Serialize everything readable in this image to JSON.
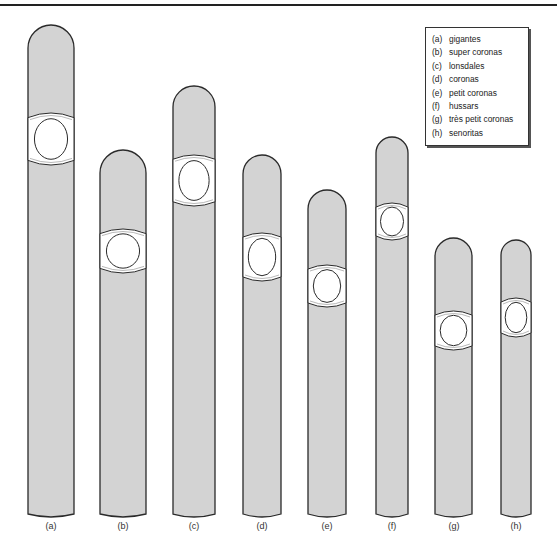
{
  "figure": {
    "colors": {
      "body_fill": "#d3d3d3",
      "outline": "#2a2a2a",
      "band_fill": "#ffffff"
    },
    "cigars": [
      {
        "key": "(a)",
        "name": "gigantes",
        "x": 28,
        "w": 46,
        "top": 25,
        "bottom": 514,
        "band_top": 113,
        "band_bottom": 165
      },
      {
        "key": "(b)",
        "name": "super coronas",
        "x": 100,
        "w": 46,
        "top": 150,
        "bottom": 514,
        "band_top": 229,
        "band_bottom": 273
      },
      {
        "key": "(c)",
        "name": "lonsdales",
        "x": 173,
        "w": 42,
        "top": 86,
        "bottom": 514,
        "band_top": 155,
        "band_bottom": 206
      },
      {
        "key": "(d)",
        "name": "coronas",
        "x": 243,
        "w": 38,
        "top": 155,
        "bottom": 514,
        "band_top": 233,
        "band_bottom": 281
      },
      {
        "key": "(e)",
        "name": "petit coronas",
        "x": 308,
        "w": 38,
        "top": 190,
        "bottom": 514,
        "band_top": 265,
        "band_bottom": 307
      },
      {
        "key": "(f)",
        "name": "hussars",
        "x": 376,
        "w": 32,
        "top": 137,
        "bottom": 514,
        "band_top": 203,
        "band_bottom": 240
      },
      {
        "key": "(g)",
        "name": "très petit coronas",
        "x": 435,
        "w": 37,
        "top": 238,
        "bottom": 514,
        "band_top": 311,
        "band_bottom": 350
      },
      {
        "key": "(h)",
        "name": "senoritas",
        "x": 501,
        "w": 30,
        "top": 240,
        "bottom": 514,
        "band_top": 298,
        "band_bottom": 337
      }
    ]
  },
  "legend": {
    "items": [
      {
        "key": "(a)",
        "label": "gigantes"
      },
      {
        "key": "(b)",
        "label": "super coronas"
      },
      {
        "key": "(c)",
        "label": "lonsdales"
      },
      {
        "key": "(d)",
        "label": "coronas"
      },
      {
        "key": "(e)",
        "label": "petit coronas"
      },
      {
        "key": "(f)",
        "label": "hussars"
      },
      {
        "key": "(g)",
        "label": "très petit coronas"
      },
      {
        "key": "(h)",
        "label": "senoritas"
      }
    ]
  },
  "labels": [
    "(a)",
    "(b)",
    "(c)",
    "(d)",
    "(e)",
    "(f)",
    "(g)",
    "(h)"
  ]
}
